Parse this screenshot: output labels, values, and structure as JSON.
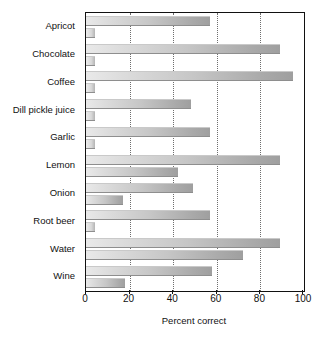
{
  "chart_data": {
    "type": "bar",
    "orientation": "horizontal",
    "title": "",
    "subtitle": "",
    "xlabel": "Percent correct",
    "ylabel": "",
    "xlim": [
      0,
      100
    ],
    "xticks": [
      0,
      20,
      40,
      60,
      80,
      100
    ],
    "xtick_labels": [
      "0",
      "20",
      "40",
      "60",
      "80",
      "100"
    ],
    "grid": "vertical-dotted",
    "legend": "none",
    "categories": [
      "Apricot",
      "Chocolate",
      "Coffee",
      "Dill pickle juice",
      "Garlic",
      "Lemon",
      "Onion",
      "Root beer",
      "Water",
      "Wine"
    ],
    "series": [
      {
        "name": "series-1",
        "values": [
          57,
          89,
          95,
          48,
          57,
          89,
          49,
          57,
          89,
          58
        ]
      },
      {
        "name": "series-2",
        "values": [
          4,
          4,
          4,
          4,
          4,
          42,
          17,
          4,
          72,
          18
        ]
      }
    ],
    "colors": {
      "bar_light": "#e9e9e9",
      "bar_dark": "#9f9f9f",
      "axis": "#111111",
      "gridline": "#6e6e6e",
      "background": "#ffffff"
    }
  }
}
